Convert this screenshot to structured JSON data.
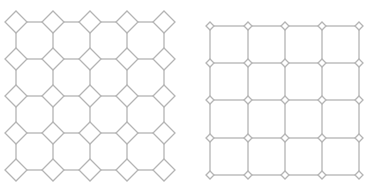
{
  "diagram": {
    "stroke_color": "#b4b4b4",
    "background": "#ffffff",
    "panels": [
      {
        "name": "left-lattice",
        "description": "octagon-square tiling",
        "xs": [
          16,
          53,
          90,
          127,
          164
        ],
        "ys": [
          22,
          59,
          96,
          133,
          170
        ],
        "diamond_half": 11
      },
      {
        "name": "right-lattice",
        "description": "square grid with small diamond nodes",
        "xs": [
          210,
          248,
          285,
          322,
          359
        ],
        "ys": [
          26,
          63,
          100,
          138,
          175
        ],
        "diamond_half": 4
      }
    ]
  }
}
